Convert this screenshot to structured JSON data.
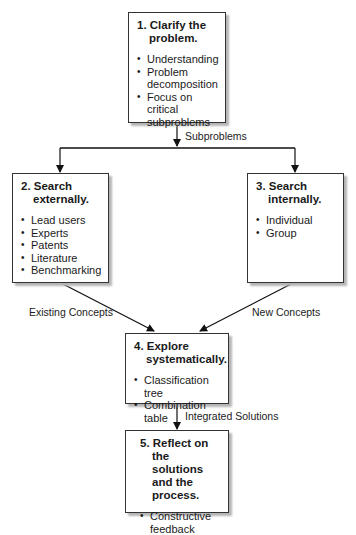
{
  "boxes": [
    {
      "id": "clarify",
      "title": "1. Clarify the problem.",
      "items": [
        "Understanding",
        "Problem decomposition",
        "Focus on critical subproblems"
      ]
    },
    {
      "id": "search-externally",
      "title": "2. Search externally.",
      "items": [
        "Lead users",
        "Experts",
        "Patents",
        "Literature",
        "Benchmarking"
      ]
    },
    {
      "id": "search-internally",
      "title": "3. Search internally.",
      "items": [
        "Individual",
        "Group"
      ]
    },
    {
      "id": "explore",
      "title": "4. Explore systematically.",
      "items": [
        "Classification tree",
        "Combination table"
      ]
    },
    {
      "id": "reflect",
      "title": "5. Reflect on the solutions and the process.",
      "items": [
        "Constructive feedback"
      ]
    }
  ],
  "edge_labels": {
    "subproblems": "Subproblems",
    "existing_concepts": "Existing Concepts",
    "new_concepts": "New Concepts",
    "integrated_solutions": "Integrated Solutions"
  }
}
